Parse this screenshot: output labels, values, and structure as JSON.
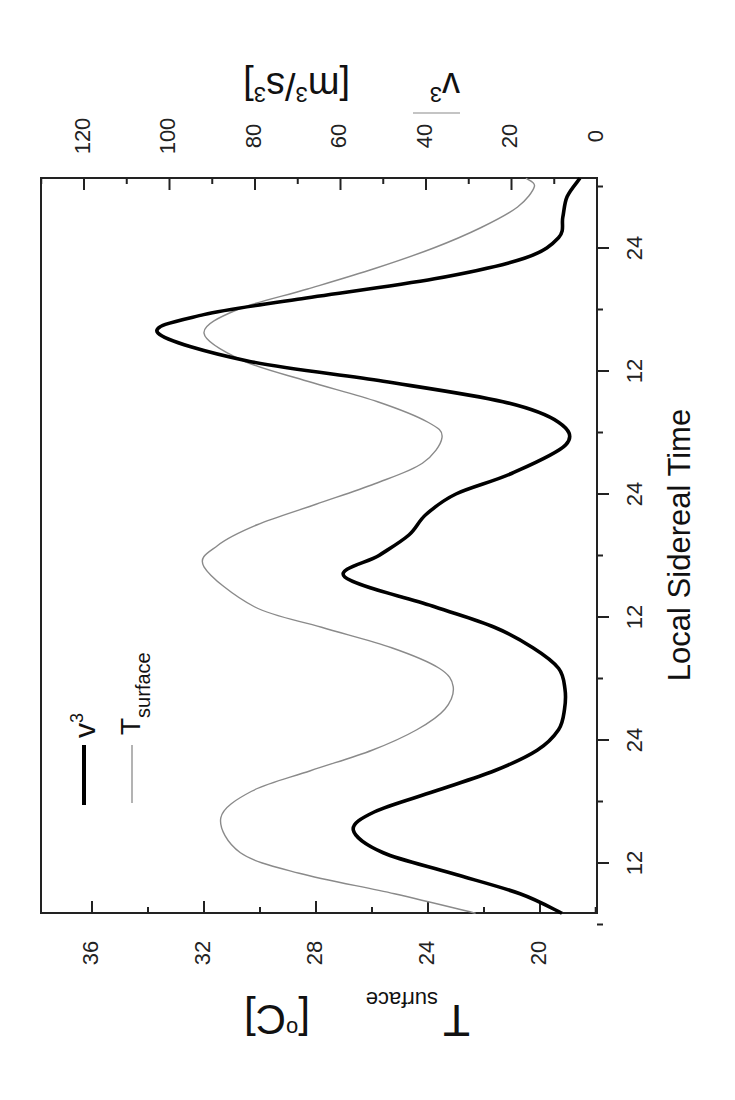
{
  "chart_data": {
    "type": "line",
    "orientation_note_visible": "figure rotated 90 degrees clockwise",
    "xlabel": "Local Sidereal Time",
    "ylabel_left": "T_surface [oC]",
    "ylabel_right": "v3 [m3/s3]",
    "x_tick_labels": [
      "12",
      "24",
      "12",
      "24",
      "12",
      "24"
    ],
    "x_tick_positions_continuous_hours": [
      12,
      24,
      36,
      48,
      60,
      72
    ],
    "x_range_continuous_hours": [
      7.1,
      78.8
    ],
    "y_left_ticks": [
      20,
      24,
      28,
      32,
      36
    ],
    "y_left_range": [
      18,
      38
    ],
    "y_right_ticks": [
      0,
      20,
      40,
      60,
      80,
      100,
      120
    ],
    "y_right_range": [
      0,
      130
    ],
    "grid": false,
    "legend_position": "upper left",
    "series": [
      {
        "name": "v3",
        "legend_label": "v",
        "legend_sup": "3",
        "axis": "right",
        "style": "thick black",
        "x": [
          7.1,
          9,
          11,
          13,
          15.2,
          17,
          19,
          21,
          23,
          25,
          27,
          29,
          31,
          33,
          35,
          37,
          39.9,
          42,
          44,
          46,
          48,
          50,
          52.8,
          55,
          57,
          59,
          61,
          63.7,
          65.5,
          67,
          69,
          71,
          73,
          75,
          77,
          78.8
        ],
        "values": [
          8.2,
          18,
          34,
          50,
          57,
          52,
          38,
          24,
          14,
          9,
          7.6,
          7.5,
          9,
          15,
          24,
          38,
          59,
          51,
          44,
          40,
          33,
          20,
          7.3,
          9,
          22,
          50,
          82,
          102.7,
          92,
          70,
          38,
          17,
          9,
          8,
          7,
          4
        ]
      },
      {
        "name": "T_surface",
        "legend_label": "T",
        "legend_sub": "surface",
        "axis": "left",
        "style": "thin gray",
        "x": [
          7.1,
          9,
          11,
          13,
          16.4,
          19,
          21,
          23,
          25,
          27,
          29.2,
          31,
          33,
          35,
          37,
          40.9,
          43,
          45,
          47,
          49,
          51,
          53.5,
          55,
          57,
          59,
          61,
          63.7,
          66,
          68,
          70,
          72,
          74,
          76,
          78,
          78.8
        ],
        "values": [
          22.3,
          25.2,
          28.6,
          30.7,
          31.4,
          30.3,
          28.2,
          26.0,
          24.4,
          23.4,
          23.1,
          23.6,
          25.3,
          27.8,
          30.2,
          32.0,
          31.5,
          30.1,
          28.0,
          25.9,
          24.2,
          23.5,
          24.0,
          25.8,
          28.3,
          30.6,
          32.0,
          30.8,
          28.3,
          25.9,
          23.8,
          22.1,
          20.8,
          20.2,
          20.5
        ]
      }
    ]
  },
  "labels": {
    "x_axis_title": "Local Sidereal Time",
    "left_axis_title_main": "T",
    "left_axis_title_sub": "surface",
    "left_axis_title_unit": "[oC]",
    "right_axis_title_var": "v3",
    "right_axis_title_unit": "[m3/s3]",
    "legend_v": "v",
    "legend_v_sup": "3",
    "legend_t": "T",
    "legend_t_sub": "surface"
  },
  "colors": {
    "v3_line": "#000000",
    "t_line": "#8a8a8a",
    "axis": "#222222"
  }
}
